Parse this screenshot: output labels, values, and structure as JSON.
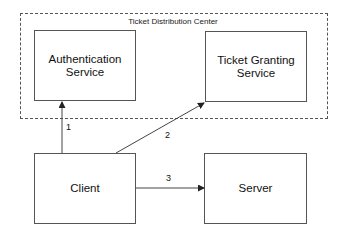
{
  "diagram": {
    "region": {
      "title": "Ticket Distribution Center",
      "x": 20,
      "y": 13,
      "w": 308,
      "h": 106
    },
    "nodes": [
      {
        "id": "auth",
        "lines": [
          "Authentication",
          "Service"
        ],
        "x": 34,
        "y": 30,
        "w": 102,
        "h": 71
      },
      {
        "id": "tgs",
        "lines": [
          "Ticket Granting",
          "Service"
        ],
        "x": 205,
        "y": 31,
        "w": 102,
        "h": 71
      },
      {
        "id": "client",
        "lines": [
          "Client"
        ],
        "x": 34,
        "y": 153,
        "w": 102,
        "h": 71
      },
      {
        "id": "server",
        "lines": [
          "Server"
        ],
        "x": 204,
        "y": 153,
        "w": 103,
        "h": 71
      }
    ],
    "edges": [
      {
        "id": "edge-1",
        "label": "1",
        "from": "client",
        "to": "auth",
        "x1": 62,
        "y1": 153,
        "x2": 62,
        "y2": 102,
        "lx": 66,
        "ly": 122
      },
      {
        "id": "edge-2",
        "label": "2",
        "from": "client",
        "to": "tgs",
        "x1": 116,
        "y1": 153,
        "x2": 204,
        "y2": 103,
        "lx": 165,
        "ly": 130
      },
      {
        "id": "edge-3",
        "label": "3",
        "from": "client",
        "to": "server",
        "x1": 136,
        "y1": 188,
        "x2": 204,
        "y2": 188,
        "lx": 166,
        "ly": 173
      }
    ],
    "colors": {
      "stroke": "#555555",
      "text": "#111111",
      "background": "#ffffff"
    }
  }
}
